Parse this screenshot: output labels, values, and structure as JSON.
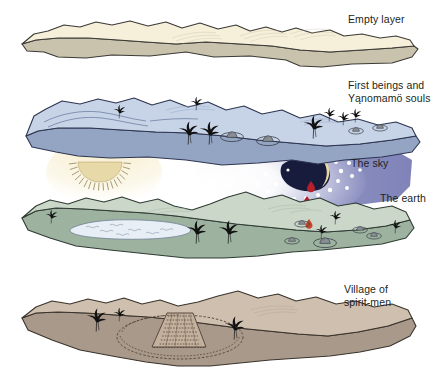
{
  "figure": {
    "background_color": "#ffffff",
    "width": 445,
    "height": 392
  },
  "labels": {
    "empty_layer": "Empty layer",
    "first_beings": "First beings and\nYąnomamö souls",
    "the_sky": "The sky",
    "the_earth": "The earth",
    "village_of_spirit_men": "Village of\nspirit-men"
  },
  "layers": [
    {
      "id": "empty-layer",
      "name": "Empty layer",
      "order": 1,
      "top_color": "#f6efda",
      "side_color": "#c9c2ac",
      "outline_color": "#3b3a36",
      "features": []
    },
    {
      "id": "first-beings-layer",
      "name": "First beings and Yąnomamö souls",
      "order": 2,
      "top_color": "#c7d4e8",
      "side_color": "#94a5c4",
      "outline_color": "#2d3550",
      "features": [
        "palm-trees",
        "shabono-huts",
        "ridge-lines",
        "sky-hole"
      ]
    },
    {
      "id": "earth-layer",
      "name": "The earth",
      "order": 3,
      "top_color": "#cbd8c9",
      "side_color": "#9db3a0",
      "outline_color": "#2f3b33",
      "features": [
        "palm-trees",
        "shabono-huts",
        "lake",
        "ridge-lines",
        "blood-drop"
      ]
    },
    {
      "id": "village-layer",
      "name": "Village of spirit-men",
      "order": 4,
      "top_color": "#cfbfae",
      "side_color": "#a9998a",
      "outline_color": "#3a332c",
      "features": [
        "palm-trees",
        "shabono-village"
      ]
    }
  ],
  "sky_elements": {
    "sun": {
      "name": "sun",
      "shape": "half-disc with radiating rays",
      "fill_color": "#e8d9a8",
      "ray_color": "#8a7c4e"
    },
    "night_sky": {
      "name": "night sky glow",
      "fill_color": "#8b8fc0",
      "glow_color": "#ffffff"
    },
    "hole": {
      "name": "hole in the sky",
      "fill_color": "#171c3c"
    },
    "moon": {
      "name": "crescent moon",
      "fill_color": "#e8d9a8"
    },
    "stars": {
      "name": "stars",
      "fill_color": "#ffffff",
      "count": 17
    },
    "blood_drops": {
      "name": "blood drops",
      "fill_color": "#b5202a",
      "count": 3
    }
  },
  "motifs": {
    "palm_tree_color": "#111111",
    "hut_color": "#8a8f96",
    "lake_color": "#e8eef6"
  }
}
